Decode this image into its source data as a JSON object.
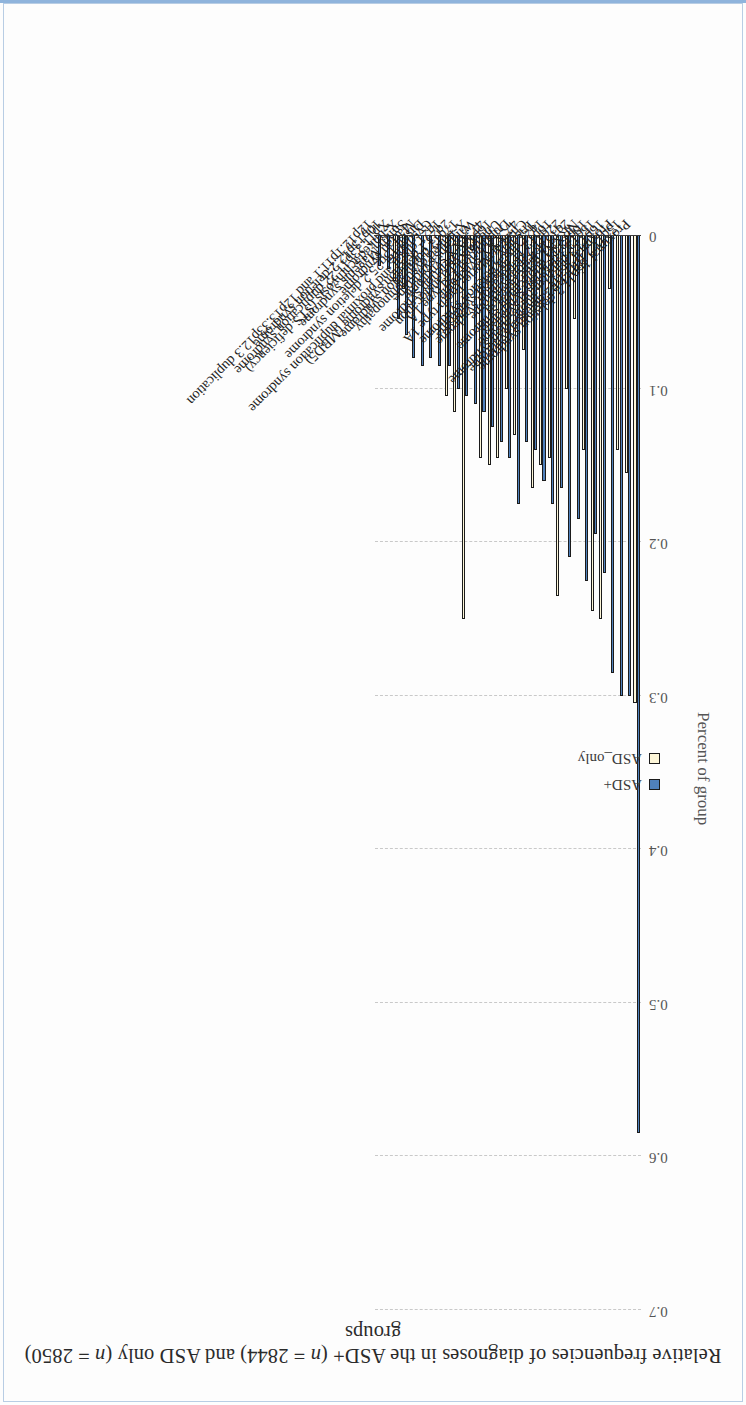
{
  "figure": {
    "title_plain": "Relative frequencies of diagnoses in the ASD+ (n = 2844) and ASD only (n = 2850) groups"
  },
  "legend": {
    "position": "bottom-left",
    "entries": [
      {
        "label": "ASD+",
        "color": "#4f81bd"
      },
      {
        "label": "ASD_only",
        "color": "#fdf6d8"
      }
    ]
  },
  "axis": {
    "y_title": "Percent of group",
    "ticks": [
      "0",
      "0.1",
      "0.2",
      "0.3",
      "0.4",
      "0.5",
      "0.6",
      "0.7"
    ]
  },
  "chart_data": {
    "type": "bar",
    "title": "Relative frequencies of diagnoses in the ASD+ (n = 2844) and ASD only (n = 2850) groups",
    "xlabel": "",
    "ylabel": "Percent of group",
    "ylim": [
      0,
      0.7
    ],
    "grid": true,
    "orientation": "vertical",
    "legend_position": "bottom-left",
    "categories": [
      "Proximal 16p11.2 deletion syndrome",
      "15q11.2 BP1-BP2 deletion syndrome",
      "Proximal 16p11.2 duplication syndrome",
      "16p13.3 duplication syndrome",
      "15q13.3 deletion syndrome",
      "16p13.11 duplication syndrome",
      "NRXN1 gene deletion",
      "2q13 deletion syndrome",
      "22q11.2 duplication syndrome",
      "16p13.11 deletion syndrome",
      "1q21 distal deletion syndrome",
      "Trisomy 21",
      "Charcot-Marie-Tooth type 1A",
      "47,XXY syndrome",
      "Duplication 15q type 1A",
      "Unbalanced translocation",
      "16p12.2 deletion syndrome",
      "47,XXX syndrome",
      "Williams syndrome",
      "X-linked dystrophinopathy",
      "17q12 duplication syndrome",
      "2q23.1 deletion syndrome (MBD5)",
      "1q21 distal and proximal duplication syndrome",
      "Cystinuria",
      "Distal 15q25.2 deletion syndrome",
      "Marfan syndrome",
      "Smith-Magenis syndrome",
      "X-linked ichthyosis (STS deficiency)",
      "Xp11.23p11.22 duplication syndrome",
      "10p13p12.2 deletion syndrome",
      "12p12.1p11.1 and 12p13.33p12.3 duplication"
    ],
    "series": [
      {
        "name": "ASD+",
        "color": "#4f81bd",
        "values": [
          0.585,
          0.3,
          0.3,
          0.285,
          0.22,
          0.195,
          0.225,
          0.185,
          0.21,
          0.165,
          0.175,
          0.16,
          0.14,
          0.135,
          0.175,
          0.145,
          0.135,
          0.125,
          0.115,
          0.11,
          0.105,
          0.1,
          0.085,
          0.085,
          0.08,
          0.085,
          0.08,
          0.065,
          0.055,
          0.022,
          0.02
        ]
      },
      {
        "name": "ASD_only",
        "color": "#fdf6d8",
        "values": [
          0.305,
          0.155,
          0.14,
          0.035,
          0.25,
          0.245,
          0.14,
          0.055,
          0.1,
          0.235,
          0.145,
          0.15,
          0.165,
          0.075,
          0.13,
          0.1,
          0.145,
          0.15,
          0.145,
          0.01,
          0.25,
          0.115,
          0.105,
          0.0,
          0.0,
          0.0,
          0.0,
          0.035,
          0.03,
          0.0,
          0.0
        ]
      }
    ]
  }
}
